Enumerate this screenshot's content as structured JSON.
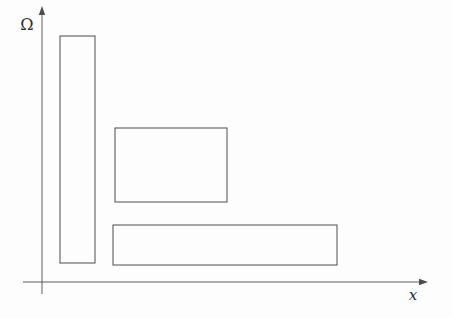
{
  "figure": {
    "background": "#fdfdfd",
    "line_color": "#4d4d4d",
    "axes": {
      "y_label": "Ω",
      "x_label": "x",
      "origin": {
        "x": 42,
        "y": 282
      },
      "y_axis": {
        "x": 42,
        "top": 12,
        "bottom": 294,
        "arrow_tip_y": 6
      },
      "x_axis": {
        "y": 282,
        "left": 23,
        "right": 421,
        "arrow_tip_x": 428
      },
      "y_label_pos": {
        "x": 27,
        "y": 30,
        "font_size": 16
      },
      "x_label_pos": {
        "x": 413,
        "y": 300,
        "font_size": 15
      }
    },
    "rectangles": [
      {
        "name": "tall-vertical-rectangle",
        "x": 60,
        "y": 36,
        "width": 35,
        "height": 227
      },
      {
        "name": "middle-rectangle",
        "x": 115,
        "y": 128,
        "width": 112,
        "height": 74
      },
      {
        "name": "wide-bottom-rectangle",
        "x": 113,
        "y": 225,
        "width": 224,
        "height": 40
      }
    ]
  }
}
